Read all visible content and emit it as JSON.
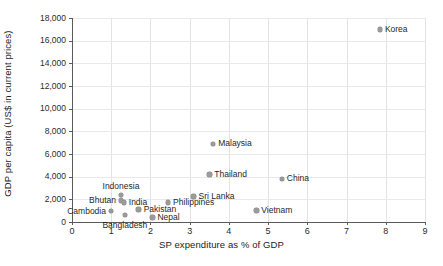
{
  "chart_data": {
    "type": "scatter",
    "title": "",
    "xlabel": "SP expenditure as % of GDP",
    "ylabel": "GDP per capita (US$ in current prices)",
    "xlim": [
      0,
      9
    ],
    "ylim": [
      0,
      18000
    ],
    "grid": true,
    "legend": "none",
    "xticks": [
      "0",
      "1",
      "2",
      "3",
      "4",
      "5",
      "6",
      "7",
      "8",
      "9"
    ],
    "xtick_values": [
      0,
      1,
      2,
      3,
      4,
      5,
      6,
      7,
      8,
      9
    ],
    "yticks": [
      "0",
      "2,000",
      "4,000",
      "6,000",
      "8,000",
      "10,000",
      "12,000",
      "14,000",
      "16,000",
      "18,000"
    ],
    "ytick_values": [
      0,
      2000,
      4000,
      6000,
      8000,
      10000,
      12000,
      14000,
      16000,
      18000
    ],
    "marker_color": "#9b9b9b",
    "points": [
      {
        "label": "Korea",
        "x": 7.85,
        "y": 17000,
        "label_pos": "right"
      },
      {
        "label": "Malaysia",
        "x": 3.6,
        "y": 6900,
        "label_pos": "right"
      },
      {
        "label": "Thailand",
        "x": 3.5,
        "y": 4200,
        "label_pos": "right"
      },
      {
        "label": "China",
        "x": 5.35,
        "y": 3800,
        "label_pos": "right"
      },
      {
        "label": "Indonesia",
        "x": 1.25,
        "y": 2400,
        "label_pos": "above"
      },
      {
        "label": "Sri Lanka",
        "x": 3.1,
        "y": 2250,
        "label_pos": "right"
      },
      {
        "label": "Bhutan",
        "x": 1.25,
        "y": 1900,
        "label_pos": "left"
      },
      {
        "label": "India",
        "x": 1.32,
        "y": 1700,
        "label_pos": "right"
      },
      {
        "label": "Philippines",
        "x": 2.45,
        "y": 1700,
        "label_pos": "right"
      },
      {
        "label": "Pakistan",
        "x": 1.7,
        "y": 1100,
        "label_pos": "right"
      },
      {
        "label": "Vietnam",
        "x": 4.7,
        "y": 1000,
        "label_pos": "right"
      },
      {
        "label": "Cambodia",
        "x": 1.0,
        "y": 950,
        "label_pos": "left"
      },
      {
        "label": "Bangladesh",
        "x": 1.35,
        "y": 600,
        "label_pos": "below"
      },
      {
        "label": "Nepal",
        "x": 2.05,
        "y": 400,
        "label_pos": "right"
      }
    ]
  }
}
